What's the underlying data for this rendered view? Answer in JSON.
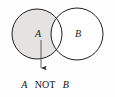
{
  "figure": {
    "kind": "venn-diagram",
    "caption": {
      "operand_left": "A",
      "operator": "NOT",
      "operand_right": "B",
      "full_text": "A NOT B"
    },
    "colors": {
      "background": "#fefefe",
      "stroke": "#1a1a1a",
      "shaded_fill": "#e4e3e1",
      "unshaded_fill": "#ffffff",
      "text": "#111111",
      "arrow": "#333333"
    },
    "sets": [
      {
        "id": "set-a",
        "label": "A",
        "shaded": "true",
        "label_x": 38,
        "label_y": 37,
        "cx": 37,
        "cy": 34,
        "r": 25
      },
      {
        "id": "set-b",
        "label": "B",
        "shaded": "false",
        "label_x": 78,
        "label_y": 37,
        "cx": 77,
        "cy": 34,
        "r": 26
      }
    ],
    "annotation": {
      "name": "pointer-arrow",
      "from_x": 41,
      "from_y": 39,
      "to_x": 41,
      "to_y": 73,
      "head": "solid-triangle",
      "points_to": "A NOT B"
    },
    "region_description": {
      "shaded_region": "A minus B",
      "intersection_shaded": "false"
    }
  }
}
